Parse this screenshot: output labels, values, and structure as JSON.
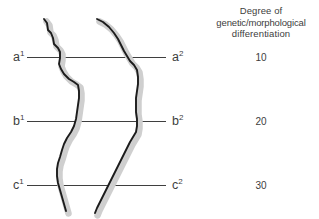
{
  "figure": {
    "title": "",
    "background_color": "#ffffff",
    "line_color": "#3f3f3f",
    "curve_color": "#1c1c1c",
    "curve_shadow_color": "#cfcfcf",
    "text_color": "#3d3d3d"
  },
  "legend": {
    "header_lines": [
      "Degree of",
      "genetic/morphological",
      "differentiation"
    ]
  },
  "rows": [
    {
      "left_label": "a",
      "left_superscript": "1",
      "right_label": "a",
      "right_superscript": "2",
      "value": "10",
      "y": 57
    },
    {
      "left_label": "b",
      "left_superscript": "1",
      "right_label": "b",
      "right_superscript": "2",
      "value": "20",
      "y": 121
    },
    {
      "left_label": "c",
      "left_superscript": "1",
      "right_label": "c",
      "right_superscript": "2",
      "value": "30",
      "y": 185
    }
  ],
  "clines": [
    {
      "name": "left-cline",
      "path": "M 44 19 L 47 23 L 48 30 L 51 33 L 53 38 L 54 44 L 58 48 L 60 52 L 60 58 L 59 64 L 61 69 L 64 74 L 69 79 L 74 82 L 78 85 L 79 91 L 79 98 L 78 105 L 77 112 L 76 119 L 74 126 L 71 132 L 67 138 L 64 144 L 62 150 L 60 157 L 58 163 L 57 169 L 57 176 L 58 183 L 60 190 L 62 197 L 64 204 L 66 211"
    },
    {
      "name": "right-cline",
      "path": "M 97 19 L 103 22 L 109 27 L 114 33 L 118 39 L 121 45 L 124 51 L 127 56 L 130 61 L 134 65 L 137 70 L 138 77 L 138 84 L 137 91 L 136 98 L 136 105 L 136 112 L 137 119 L 137 126 L 136 132 L 133 137 L 130 142 L 127 148 L 124 154 L 121 160 L 118 166 L 115 172 L 112 178 L 109 184 L 106 190 L 103 196 L 100 202 L 97 208 L 95 213"
    }
  ]
}
